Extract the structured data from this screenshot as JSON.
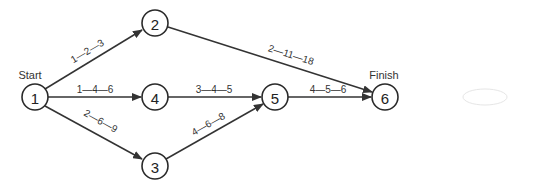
{
  "diagram": {
    "type": "PERT network",
    "start_label": "Start",
    "finish_label": "Finish",
    "nodes": [
      {
        "id": "1",
        "label": "1",
        "x": 35,
        "y": 97
      },
      {
        "id": "2",
        "label": "2",
        "x": 155,
        "y": 23
      },
      {
        "id": "3",
        "label": "3",
        "x": 155,
        "y": 166
      },
      {
        "id": "4",
        "label": "4",
        "x": 155,
        "y": 97
      },
      {
        "id": "5",
        "label": "5",
        "x": 275,
        "y": 97
      },
      {
        "id": "6",
        "label": "6",
        "x": 385,
        "y": 97
      }
    ],
    "edges": [
      {
        "from": "1",
        "to": "2",
        "label": "1—2—3"
      },
      {
        "from": "1",
        "to": "4",
        "label": "1—4—6"
      },
      {
        "from": "1",
        "to": "3",
        "label": "2—6—9"
      },
      {
        "from": "2",
        "to": "6",
        "label": "2—11—18"
      },
      {
        "from": "4",
        "to": "5",
        "label": "3—4—5"
      },
      {
        "from": "3",
        "to": "5",
        "label": "4—6—8"
      },
      {
        "from": "5",
        "to": "6",
        "label": "4—5—6"
      }
    ]
  }
}
